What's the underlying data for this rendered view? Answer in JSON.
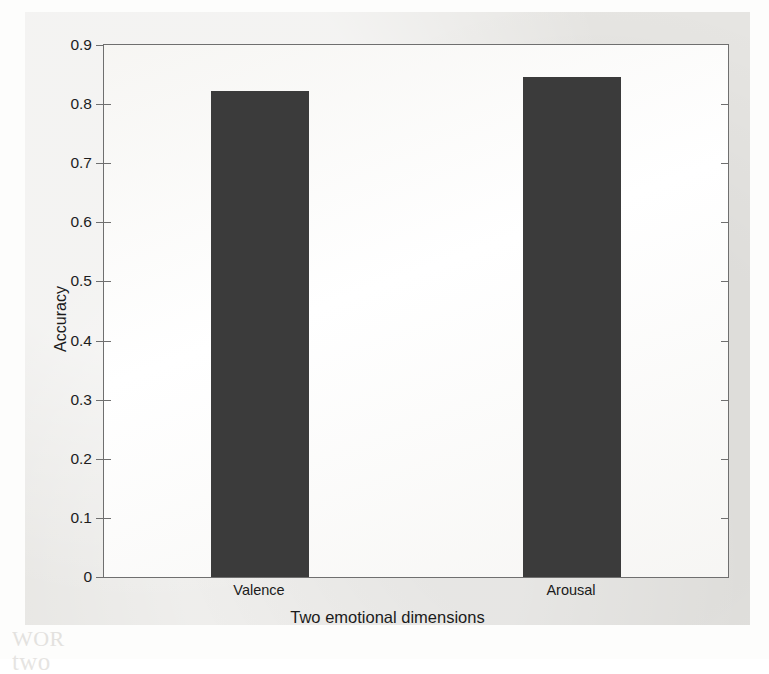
{
  "chart_data": {
    "type": "bar",
    "title": "",
    "subtitle": "",
    "categories": [
      "Valence",
      "Arousal"
    ],
    "values": [
      0.822,
      0.846
    ],
    "series": [
      {
        "name": "Accuracy",
        "values": [
          0.822,
          0.846
        ]
      }
    ],
    "xlabel": "Two emotional dimensions",
    "ylabel": "Accuracy",
    "ylim": [
      0,
      0.9
    ],
    "xlim": [
      0,
      1
    ],
    "yticks": [
      0,
      0.1,
      0.2,
      0.3,
      0.4,
      0.5,
      0.6,
      0.7,
      0.8,
      0.9
    ],
    "ytick_labels": [
      "0",
      "0.1",
      "0.2",
      "0.3",
      "0.4",
      "0.5",
      "0.6",
      "0.7",
      "0.8",
      "0.9"
    ],
    "grid": false,
    "legend": false,
    "legend_position": "none",
    "bar_color": "#3b3b3b",
    "axis_color": "#6f6f6f",
    "plot_background": "#ffffff",
    "figure_background": "#e6e5e2",
    "annotations": []
  },
  "figure": {
    "xaxis_title": "Two emotional dimensions",
    "yaxis_title": "Accuracy",
    "category_labels": [
      "Valence",
      "Arousal"
    ],
    "ytick_labels": [
      "0.9",
      "0.8",
      "0.7",
      "0.6",
      "0.5",
      "0.4",
      "0.3",
      "0.2",
      "0.1",
      "0"
    ]
  },
  "background_text": {
    "ghost_1": "The de",
    "ghost_2": "of",
    "ghost_3": "WOR",
    "ghost_4": "two",
    "ghost_5": "tion",
    "ghost_6": "dim"
  }
}
